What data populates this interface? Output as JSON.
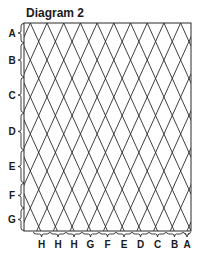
{
  "title": "Diagram 2",
  "row_labels": [
    {
      "label": "A",
      "y0": 23,
      "y1": 43
    },
    {
      "label": "B",
      "y0": 43,
      "y1": 77
    },
    {
      "label": "C",
      "y0": 77,
      "y1": 113
    },
    {
      "label": "D",
      "y0": 113,
      "y1": 150
    },
    {
      "label": "E",
      "y0": 150,
      "y1": 183
    },
    {
      "label": "F",
      "y0": 183,
      "y1": 208
    },
    {
      "label": "G",
      "y0": 208,
      "y1": 231
    }
  ],
  "column_labels": [
    {
      "label": "H",
      "x0": 33,
      "x1": 50
    },
    {
      "label": "H",
      "x0": 50,
      "x1": 66
    },
    {
      "label": "H",
      "x0": 66,
      "x1": 82
    },
    {
      "label": "G",
      "x0": 82,
      "x1": 99
    },
    {
      "label": "F",
      "x0": 99,
      "x1": 116
    },
    {
      "label": "E",
      "x0": 116,
      "x1": 132
    },
    {
      "label": "D",
      "x0": 132,
      "x1": 149
    },
    {
      "label": "C",
      "x0": 149,
      "x1": 166
    },
    {
      "label": "B",
      "x0": 166,
      "x1": 183
    },
    {
      "label": "A",
      "x0": 183,
      "x1": 191
    }
  ],
  "grid": {
    "left": 24,
    "top": 23,
    "right": 191,
    "bottom": 231,
    "diamond_width": 16.7,
    "diamond_half_height": 18.5,
    "stroke": "#2a2a2a"
  }
}
